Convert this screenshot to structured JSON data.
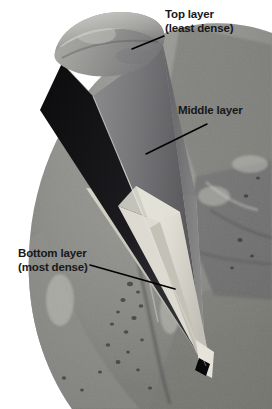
{
  "figure": {
    "type": "annotated-photo-diagram",
    "background_color": "#ffffff",
    "width": 272,
    "height": 409
  },
  "colors": {
    "text": "#17181a",
    "leader_line": "#000000",
    "page_background": "#ffffff",
    "photo_light": "#c9c9c6",
    "photo_mid": "#8d8d89",
    "photo_dark": "#56565a",
    "cone_top_layer": "#9d9d9b",
    "cone_middle_layer": "#727274",
    "cone_bottom_layer": "#d9d7cd",
    "cone_shadow_dark": "#121214",
    "tip_marker": "#08080a"
  },
  "annotations": [
    {
      "id": "top-layer",
      "line1": "Top layer",
      "line2": "(least dense)",
      "leader": {
        "x1": 164,
        "y1": 36,
        "x2": 132,
        "y2": 49
      }
    },
    {
      "id": "middle-layer",
      "line1": "Middle layer",
      "line2": "",
      "leader": {
        "x1": 207,
        "y1": 124,
        "x2": 146,
        "y2": 154
      }
    },
    {
      "id": "bottom-layer",
      "line1": "Bottom layer",
      "line2": "(most dense)",
      "leader": {
        "x1": 90,
        "y1": 265,
        "x2": 175,
        "y2": 289
      }
    }
  ],
  "scene": {
    "photo_caption": "grayscale aerial terrain photograph with circular vignette edge",
    "cone_rim_label": "elliptical open top of cone",
    "tip_marker_label": "black rectangular scale marker at cone tip"
  }
}
